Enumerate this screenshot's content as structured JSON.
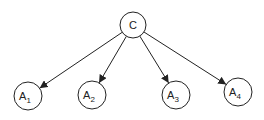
{
  "diagram": {
    "type": "tree",
    "root": {
      "id": "C",
      "label": "C",
      "cx": 133,
      "cy": 25,
      "r": 13
    },
    "children": [
      {
        "id": "A1",
        "label": "A",
        "subscript": "1",
        "cx": 28,
        "cy": 96,
        "r": 14
      },
      {
        "id": "A2",
        "label": "A",
        "subscript": "2",
        "cx": 92,
        "cy": 95,
        "r": 14
      },
      {
        "id": "A3",
        "label": "A",
        "subscript": "3",
        "cx": 176,
        "cy": 95,
        "r": 14
      },
      {
        "id": "A4",
        "label": "A",
        "subscript": "4",
        "cx": 238,
        "cy": 92,
        "r": 14
      }
    ],
    "edges": [
      {
        "from": "C",
        "to": "A1"
      },
      {
        "from": "C",
        "to": "A2"
      },
      {
        "from": "C",
        "to": "A3"
      },
      {
        "from": "C",
        "to": "A4"
      }
    ],
    "colors": {
      "stroke": "#222222",
      "fill": "#ffffff"
    }
  }
}
